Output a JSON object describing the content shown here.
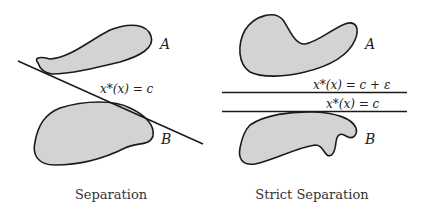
{
  "panels": [
    {
      "caption": "Separation",
      "set_a_label": "A",
      "set_b_label": "B",
      "hyperplane_label": "x*(x) = c"
    },
    {
      "caption": "Strict Separation",
      "set_a_label": "A",
      "set_b_label": "B",
      "upper_hyperplane_label": "x*(x) = c + ε",
      "lower_hyperplane_label": "x*(x) = c"
    }
  ],
  "colors": {
    "set_fill": "#d3d3d3",
    "outline": "#1a1a1a",
    "background": "#ffffff"
  }
}
